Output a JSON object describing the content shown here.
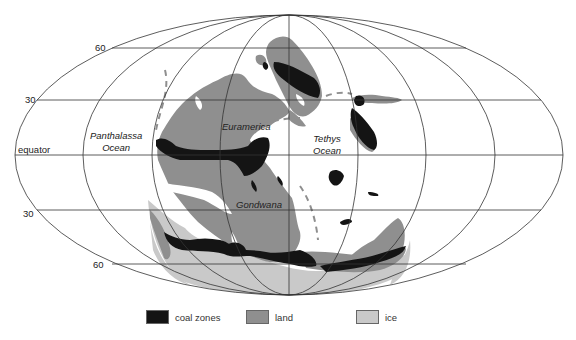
{
  "map": {
    "projection": "equal-area elliptical",
    "latitude_labels": {
      "n60": "60",
      "n30": "30",
      "equator": "equator",
      "s30": "30",
      "s60": "60"
    },
    "ocean_labels": {
      "panthalassa": [
        "Panthalassa",
        "Ocean"
      ],
      "tethys": [
        "Tethys",
        "Ocean"
      ]
    },
    "landmass_labels": {
      "euramerica": "Euramerica",
      "gondwana": "Gondwana"
    },
    "colors": {
      "coal": "#141414",
      "land": "#8f8f8f",
      "ice": "#c9c9c9",
      "grid": "#333333",
      "ocean": "#ffffff"
    }
  },
  "legend": {
    "items": [
      {
        "label": "coal zones",
        "color": "#141414"
      },
      {
        "label": "land",
        "color": "#8f8f8f"
      },
      {
        "label": "ice",
        "color": "#c9c9c9"
      }
    ]
  }
}
